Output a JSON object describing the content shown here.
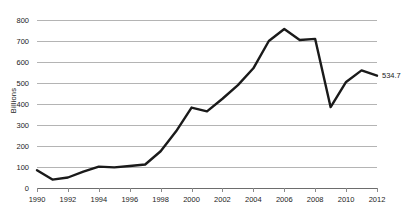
{
  "chart_data": {
    "type": "line",
    "title": "",
    "xlabel": "",
    "ylabel": "Billions",
    "ylim": [
      0,
      800
    ],
    "xlim": [
      1990,
      2012
    ],
    "ytick_step": 100,
    "xtick_step": 2,
    "grid": "horizontal",
    "legend": "none",
    "line_color": "#1a1a1a",
    "gridline_color": "#b4b4b4",
    "axis_color": "#6d6d6d",
    "yticks": [
      "800",
      "700",
      "600",
      "500",
      "400",
      "300",
      "200",
      "100",
      "0"
    ],
    "xticks": [
      "1990",
      "1992",
      "1994",
      "1996",
      "1998",
      "2000",
      "2002",
      "2004",
      "2006",
      "2008",
      "2010",
      "2012"
    ],
    "x": [
      1990,
      1991,
      1992,
      1993,
      1994,
      1995,
      1996,
      1997,
      1998,
      1999,
      2000,
      2001,
      2002,
      2003,
      2004,
      2005,
      2006,
      2007,
      2008,
      2009,
      2010,
      2011,
      2012
    ],
    "values": [
      85,
      40,
      50,
      78,
      102,
      98,
      105,
      112,
      175,
      270,
      383,
      365,
      425,
      490,
      570,
      700,
      757,
      705,
      710,
      385,
      505,
      560,
      534.7
    ],
    "annotations": [
      {
        "name": "end-value-label",
        "text": "534.7",
        "x": 2012,
        "y": 534.7
      }
    ]
  }
}
